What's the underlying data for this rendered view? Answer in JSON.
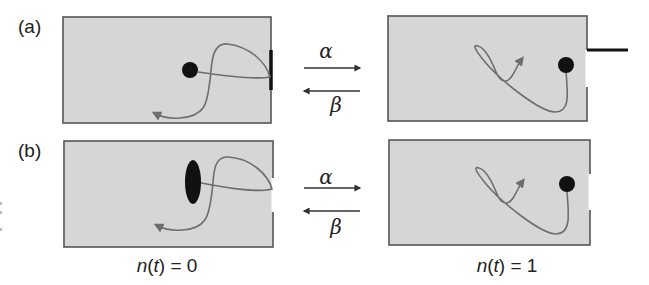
{
  "figure": {
    "rows": [
      {
        "label": "(a)",
        "forward_rate": "α",
        "backward_rate": "β",
        "left_state": {
          "particle_shape": "circle",
          "gate": "closed-bar"
        },
        "right_state": {
          "particle_shape": "circle",
          "gate": "open-lever"
        }
      },
      {
        "label": "(b)",
        "forward_rate": "α",
        "backward_rate": "β",
        "left_state": {
          "particle_shape": "ellipse",
          "gate": "open-gap"
        },
        "right_state": {
          "particle_shape": "circle",
          "gate": "open-gap"
        }
      }
    ],
    "state_labels": {
      "left": {
        "prefix": "n(",
        "var": "t",
        "suffix": ") = 0"
      },
      "right": {
        "prefix": "n(",
        "var": "t",
        "suffix": ") = 1"
      }
    }
  },
  "colors": {
    "box_fill": "#d6d6d6",
    "box_stroke": "#555555",
    "particle": "#111111",
    "trajectory": "#6e6e6e",
    "arrow": "#333333",
    "gate": "#111111"
  }
}
